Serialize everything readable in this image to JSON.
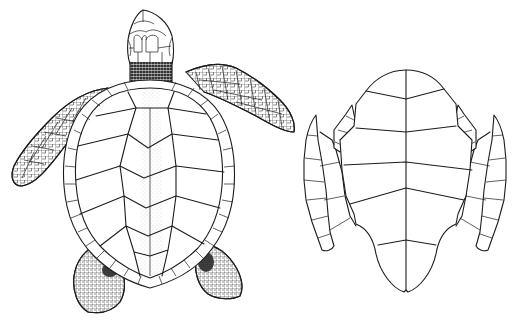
{
  "page": {
    "mark": "58"
  },
  "figure": {
    "illustrations": [
      {
        "id": "dorsal",
        "label": "carapace-view"
      },
      {
        "id": "ventral",
        "label": "plastron-view"
      }
    ]
  },
  "colors": {
    "ink": "#1c1c1c",
    "background": "#ffffff"
  }
}
